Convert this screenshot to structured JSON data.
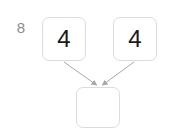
{
  "canvas": {
    "width": 169,
    "height": 136,
    "background": "#ffffff"
  },
  "problem": {
    "number_label": "8",
    "number_label_color": "#8c8c8c"
  },
  "diagram": {
    "type": "number-bond",
    "node_border_color": "#dcdcdc",
    "node_fill": "#ffffff",
    "value_color": "#1a1a1a",
    "arrow_color": "#a8a8a8",
    "nodes": [
      {
        "id": "addend-left",
        "value": "4",
        "empty": false
      },
      {
        "id": "addend-right",
        "value": "4",
        "empty": false
      },
      {
        "id": "sum",
        "value": "",
        "empty": true
      }
    ],
    "edges": [
      {
        "from": "addend-left",
        "to": "sum"
      },
      {
        "from": "addend-right",
        "to": "sum"
      }
    ]
  }
}
